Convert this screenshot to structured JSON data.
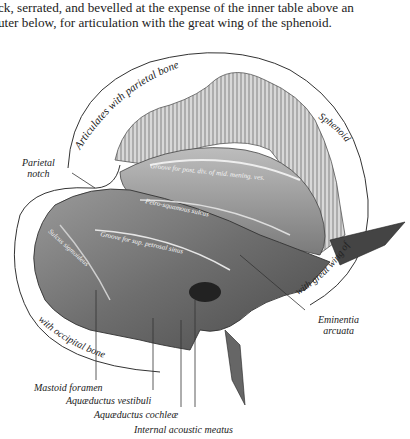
{
  "caption": {
    "line1": "ck, serrated, and bevelled at the expense of the inner table above an",
    "line2": "uter below, for articulation with the great wing of the sphenoid."
  },
  "figure": {
    "arc_labels": {
      "parietal": "Articulates with parietal bone",
      "sphenoid": "Sphenoid",
      "great_wing": "with great wing of",
      "occipital": "with occipital bone"
    },
    "surface_labels": {
      "groove_middle_meningeal": "Groove for post. div. of mid. mening. ves.",
      "petrosquamous": "Petro-squamous sulcus",
      "groove_sup_petrosal": "Groove for sup. petrosal sinus",
      "sigmoid": "Sulcus sigmoideus"
    },
    "callouts": {
      "parietal_notch": [
        "Parietal",
        "notch"
      ],
      "eminentia": [
        "Eminentia",
        "arcuata"
      ],
      "mastoid_foramen": "Mastoid foramen",
      "aqueductus_vestibuli": "Aquæductus vestibuli",
      "aqueductus_cochleae": "Aquæductus cochleæ",
      "internal_acoustic": "Internal acoustic meatus"
    }
  }
}
